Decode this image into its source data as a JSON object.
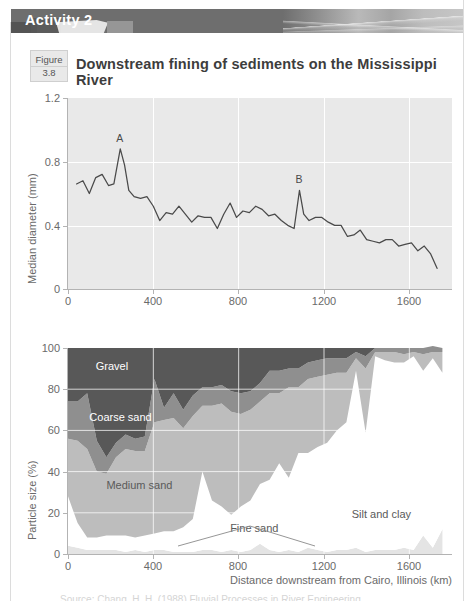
{
  "header": {
    "activity_label": "Activity 2",
    "band_color": "#6e6e6e"
  },
  "figure": {
    "figure_word": "Figure",
    "figure_number": "3.8",
    "caption": "Downstream fining of sediments on the Mississippi River"
  },
  "footer": {
    "cut_off_text": "Source: Chang, H. H. (1988) Fluvial Processes in River Engineering"
  },
  "chart_data": [
    {
      "id": "median-diameter",
      "type": "line",
      "title": "",
      "xlabel": "",
      "ylabel": "Median diameter (mm)",
      "xlim": [
        0,
        1800
      ],
      "ylim": [
        0,
        1.2
      ],
      "xticks": [
        0,
        400,
        800,
        1200,
        1600
      ],
      "yticks": [
        0,
        0.4,
        0.8,
        1.2
      ],
      "xticklabels": [
        "0",
        "400",
        "800",
        "1200",
        "1600"
      ],
      "yticklabels": [
        "0",
        "0.4",
        "0.8",
        "1.2"
      ],
      "grid": "white gridlines on grey panel",
      "line_color": "#4a4a4a",
      "panel_color": "#e9e9e9",
      "annotations": [
        {
          "text": "A",
          "x": 245,
          "y": 0.88
        },
        {
          "text": "B",
          "x": 1085,
          "y": 0.62
        }
      ],
      "x": [
        40,
        70,
        100,
        130,
        160,
        190,
        215,
        245,
        265,
        285,
        310,
        340,
        370,
        400,
        430,
        460,
        490,
        520,
        550,
        580,
        610,
        640,
        670,
        700,
        730,
        760,
        790,
        820,
        850,
        880,
        910,
        940,
        970,
        1000,
        1030,
        1060,
        1085,
        1105,
        1130,
        1160,
        1190,
        1220,
        1250,
        1280,
        1310,
        1340,
        1370,
        1400,
        1430,
        1460,
        1490,
        1520,
        1550,
        1580,
        1610,
        1640,
        1670,
        1700,
        1730
      ],
      "y": [
        0.66,
        0.68,
        0.6,
        0.7,
        0.72,
        0.65,
        0.66,
        0.88,
        0.78,
        0.62,
        0.58,
        0.57,
        0.58,
        0.52,
        0.43,
        0.48,
        0.47,
        0.52,
        0.47,
        0.42,
        0.46,
        0.45,
        0.45,
        0.38,
        0.47,
        0.54,
        0.45,
        0.49,
        0.48,
        0.52,
        0.5,
        0.46,
        0.47,
        0.43,
        0.4,
        0.38,
        0.62,
        0.47,
        0.43,
        0.45,
        0.45,
        0.42,
        0.4,
        0.4,
        0.33,
        0.34,
        0.37,
        0.31,
        0.3,
        0.29,
        0.31,
        0.31,
        0.27,
        0.28,
        0.29,
        0.24,
        0.27,
        0.22,
        0.13
      ]
    },
    {
      "id": "particle-size-composition",
      "type": "area",
      "stacked": true,
      "title": "",
      "xlabel": "Distance downstream from Cairo, Illinois (km)",
      "ylabel": "Particle size (%)",
      "xlim": [
        0,
        1800
      ],
      "ylim": [
        0,
        100
      ],
      "xticks": [
        0,
        400,
        800,
        1200,
        1600
      ],
      "yticks": [
        0,
        20,
        40,
        60,
        80,
        100
      ],
      "xticklabels": [
        "0",
        "400",
        "800",
        "1200",
        "1600"
      ],
      "yticklabels": [
        "0",
        "20",
        "40",
        "60",
        "80",
        "100"
      ],
      "series_labels": [
        "Gravel",
        "Coarse sand",
        "Medium sand",
        "Fine sand",
        "Silt and clay"
      ],
      "series_colors": [
        "#585858",
        "#8f8f8f",
        "#bdbdbd",
        "#ffffff",
        "#e4e4e4"
      ],
      "label_positions": [
        {
          "text": "Gravel",
          "x": 130,
          "y": 91,
          "color": "#ffffff"
        },
        {
          "text": "Coarse sand",
          "x": 100,
          "y": 66,
          "color": "#ffffff"
        },
        {
          "text": "Medium sand",
          "x": 180,
          "y": 33,
          "color": "#5a5a5a"
        },
        {
          "text": "Fine sand",
          "x": 760,
          "y": 12,
          "color": "#5a5a5a"
        },
        {
          "text": "Silt and clay",
          "x": 1330,
          "y": 19,
          "color": "#5a5a5a"
        }
      ],
      "x": [
        0,
        45,
        90,
        135,
        180,
        225,
        270,
        315,
        360,
        405,
        450,
        495,
        540,
        585,
        630,
        675,
        720,
        765,
        810,
        855,
        900,
        945,
        990,
        1035,
        1080,
        1125,
        1170,
        1215,
        1260,
        1305,
        1350,
        1395,
        1440,
        1485,
        1530,
        1575,
        1620,
        1665,
        1710,
        1755
      ],
      "series": [
        {
          "name": "Silt and clay",
          "values": [
            4,
            3,
            2,
            2,
            2,
            2,
            1,
            2,
            1,
            2,
            2,
            1,
            1,
            1,
            2,
            2,
            1,
            2,
            1,
            2,
            5,
            2,
            1,
            2,
            1,
            3,
            2,
            1,
            2,
            2,
            3,
            1,
            2,
            2,
            2,
            3,
            2,
            9,
            3,
            12
          ]
        },
        {
          "name": "Fine sand",
          "values": [
            24,
            12,
            6,
            6,
            7,
            7,
            8,
            6,
            8,
            8,
            9,
            10,
            12,
            16,
            38,
            24,
            22,
            17,
            22,
            24,
            29,
            34,
            43,
            35,
            48,
            46,
            50,
            53,
            58,
            62,
            86,
            58,
            94,
            92,
            91,
            90,
            94,
            80,
            92,
            76
          ]
        },
        {
          "name": "Medium sand",
          "values": [
            28,
            40,
            43,
            32,
            30,
            38,
            42,
            42,
            41,
            54,
            54,
            55,
            48,
            50,
            32,
            46,
            50,
            50,
            45,
            44,
            40,
            42,
            34,
            44,
            32,
            36,
            34,
            33,
            28,
            24,
            6,
            31,
            2,
            4,
            5,
            4,
            2,
            8,
            3,
            10
          ]
        },
        {
          "name": "Coarse sand",
          "values": [
            18,
            19,
            27,
            15,
            8,
            7,
            7,
            6,
            7,
            21,
            6,
            12,
            9,
            10,
            9,
            9,
            9,
            10,
            10,
            9,
            9,
            11,
            11,
            9,
            9,
            8,
            8,
            8,
            7,
            7,
            3,
            6,
            2,
            2,
            2,
            3,
            2,
            3,
            3,
            2
          ]
        },
        {
          "name": "Gravel",
          "values": [
            26,
            26,
            22,
            45,
            53,
            46,
            42,
            44,
            43,
            15,
            29,
            22,
            30,
            23,
            19,
            19,
            18,
            21,
            22,
            21,
            17,
            11,
            11,
            10,
            10,
            7,
            6,
            5,
            5,
            5,
            2,
            4,
            0,
            0,
            0,
            0,
            0,
            0,
            0,
            0
          ]
        }
      ]
    }
  ]
}
